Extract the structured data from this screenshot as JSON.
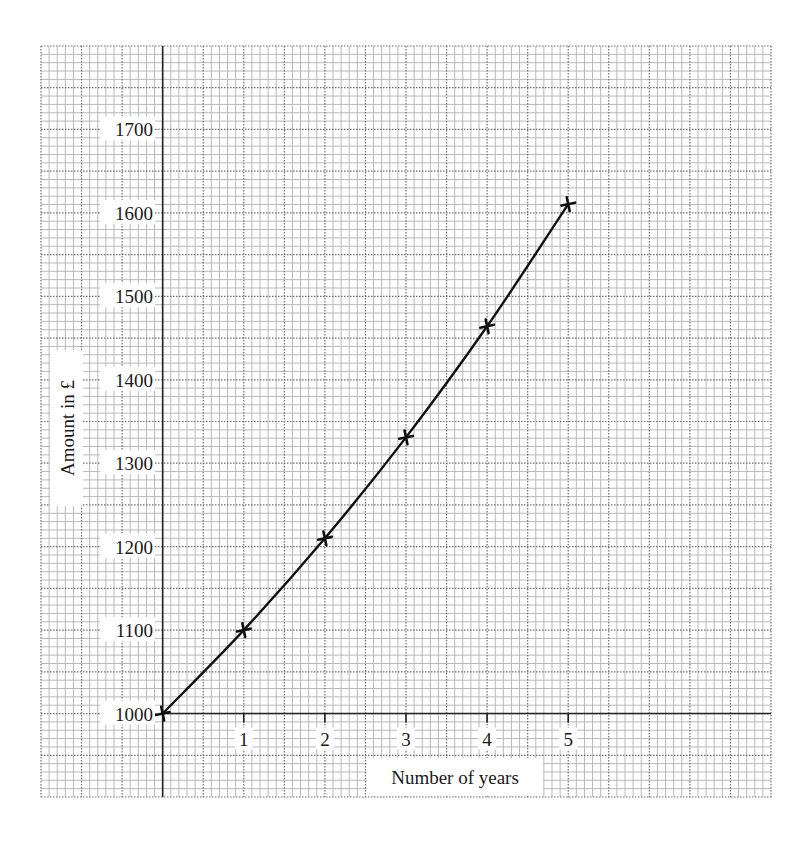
{
  "chart_data": {
    "type": "line",
    "title": "",
    "xlabel": "Number of years",
    "ylabel": "Amount in £",
    "x": [
      0,
      1,
      2,
      3,
      4,
      5
    ],
    "series": [
      {
        "name": "Amount",
        "values": [
          1000,
          1100,
          1210,
          1331,
          1464.1,
          1610.51
        ],
        "marker": "cross",
        "color": "#111111"
      }
    ],
    "x_tick_labels": [
      "1",
      "2",
      "3",
      "4",
      "5"
    ],
    "y_tick_labels": [
      "1000",
      "1100",
      "1200",
      "1300",
      "1400",
      "1500",
      "1600",
      "1700"
    ],
    "y_ticks": [
      1000,
      1100,
      1200,
      1300,
      1400,
      1500,
      1600,
      1700
    ],
    "x_ticks": [
      1,
      2,
      3,
      4,
      5
    ],
    "xlim": [
      -1.5,
      7.5
    ],
    "ylim": [
      940,
      1840
    ],
    "grid": true,
    "grid_style": "graph paper (major dotted, minor solid light)",
    "legend": "none"
  },
  "colors": {
    "background": "#ffffff",
    "minor_grid": "#b9b9b9",
    "major_grid": "#6e6e6e",
    "axis": "#222222",
    "curve": "#111111"
  }
}
